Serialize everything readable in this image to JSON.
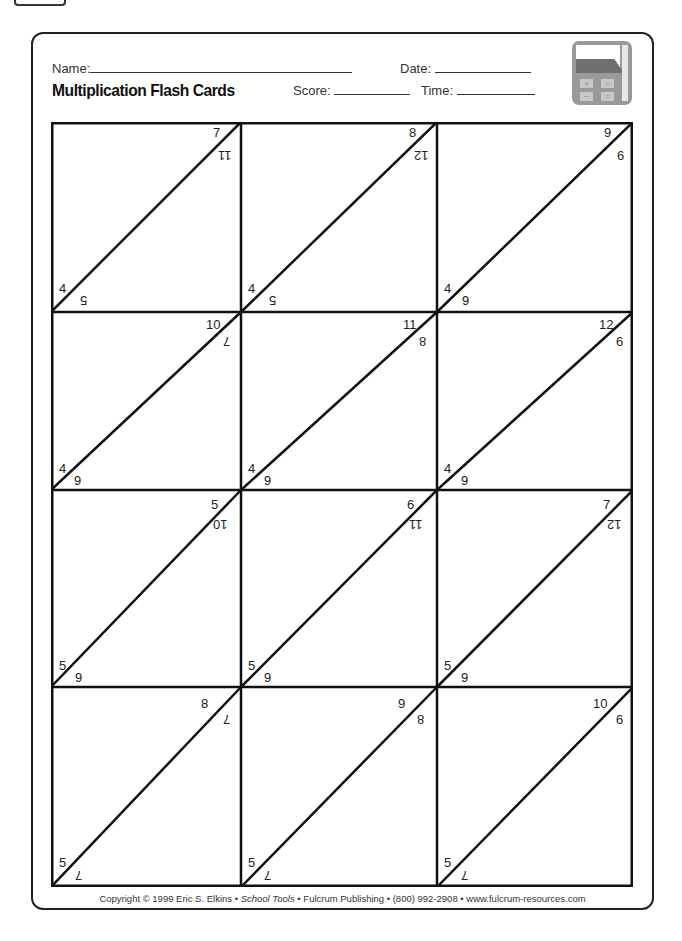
{
  "header": {
    "name_label": "Name:",
    "date_label": "Date:",
    "title": "Multiplication Flash Cards",
    "score_label": "Score:",
    "time_label": "Time:",
    "icon": "calculator-icon",
    "calc_keys": [
      "×",
      "÷",
      "−",
      "="
    ]
  },
  "cards": [
    {
      "top": "7",
      "bottom_left": "4",
      "rot_top": "11",
      "rot_bottom": "5"
    },
    {
      "top": "8",
      "bottom_left": "4",
      "rot_top": "12",
      "rot_bottom": "5"
    },
    {
      "top": "9",
      "bottom_left": "4",
      "rot_top": "9",
      "rot_bottom": "6"
    },
    {
      "top": "10",
      "bottom_left": "4",
      "rot_top": "7",
      "rot_bottom": "6"
    },
    {
      "top": "11",
      "bottom_left": "4",
      "rot_top": "8",
      "rot_bottom": "6"
    },
    {
      "top": "12",
      "bottom_left": "4",
      "rot_top": "9",
      "rot_bottom": "6"
    },
    {
      "top": "5",
      "bottom_left": "5",
      "rot_top": "10",
      "rot_bottom": "6"
    },
    {
      "top": "6",
      "bottom_left": "5",
      "rot_top": "11",
      "rot_bottom": "6"
    },
    {
      "top": "7",
      "bottom_left": "5",
      "rot_top": "12",
      "rot_bottom": "6"
    },
    {
      "top": "8",
      "bottom_left": "5",
      "rot_top": "7",
      "rot_bottom": "7"
    },
    {
      "top": "9",
      "bottom_left": "5",
      "rot_top": "8",
      "rot_bottom": "7"
    },
    {
      "top": "10",
      "bottom_left": "5",
      "rot_top": "9",
      "rot_bottom": "7"
    }
  ],
  "footer": {
    "part1": "Copyright © 1999 Eric S. Elkins • ",
    "part2": "School Tools",
    "part3": " • Fulcrum Publishing • (800) 992-2908 • www.fulcrum-resources.com"
  }
}
